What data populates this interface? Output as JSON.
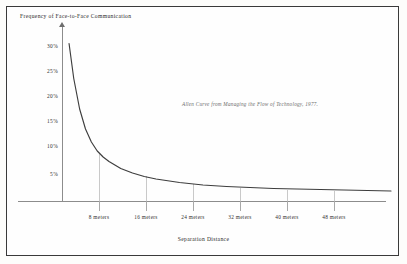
{
  "figure": {
    "border_color": "#3a3a3a",
    "background": "#fefefe",
    "curve_color": "#3d3d3d",
    "axis_color": "#8c8c8c",
    "gridline_color": "#c9c9c9",
    "annotation_color": "#6b6b6b"
  },
  "chart_data": {
    "type": "line",
    "title": "",
    "ylabel": "Frequency of Face-to-Face Communication",
    "xlabel": "Separation Distance",
    "annotation": "Allen Curve from Managing the Flow of Technology, 1977.",
    "grid": "vertical-only",
    "legend": "none",
    "xlim": [
      0,
      56
    ],
    "ylim": [
      0,
      32.5
    ],
    "xticks": [
      8,
      16,
      24,
      32,
      40,
      48
    ],
    "xtick_labels": [
      "8 meters",
      "16 meters",
      "24 meters",
      "32 meters",
      "40 meters",
      "48 meters"
    ],
    "yticks": [
      30,
      25,
      20,
      15,
      10,
      5
    ],
    "ytick_labels": [
      "30%",
      "25%",
      "20%",
      "15%",
      "10%",
      "5%"
    ],
    "x_unit": "meters",
    "y_unit": "percent",
    "series": [
      {
        "name": "Allen Curve",
        "x": [
          1.2,
          2,
          3,
          4,
          5,
          6,
          7,
          8,
          10,
          12,
          14,
          16,
          20,
          24,
          28,
          32,
          36,
          40,
          44,
          48,
          52,
          56
        ],
        "values": [
          31.5,
          24.5,
          18.4,
          14.4,
          11.8,
          10.0,
          8.8,
          7.9,
          6.5,
          5.6,
          4.9,
          4.4,
          3.7,
          3.2,
          2.9,
          2.7,
          2.5,
          2.4,
          2.3,
          2.2,
          2.1,
          2.0
        ]
      }
    ]
  },
  "axes": {
    "y_title": "Frequency of Face-to-Face Communication",
    "x_title": "Separation Distance",
    "y_labels": [
      "30%",
      "25%",
      "20%",
      "15%",
      "10%",
      "5%"
    ],
    "x_labels": [
      "8 meters",
      "16 meters",
      "24 meters",
      "32 meters",
      "40 meters",
      "48 meters"
    ]
  },
  "caption": {
    "text": "Allen Curve from Managing the Flow of Technology, 1977."
  }
}
